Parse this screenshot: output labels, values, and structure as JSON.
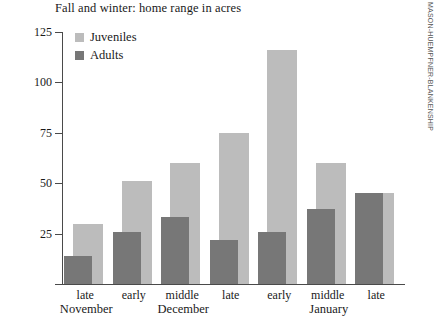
{
  "chart_data": {
    "type": "bar",
    "title": "Fall and winter: home range in acres",
    "xlabel": "",
    "ylabel": "",
    "ylim": [
      0,
      125
    ],
    "yticks": [
      25,
      50,
      75,
      100,
      125
    ],
    "grid": false,
    "legend_position": "top-left",
    "categories": [
      "late",
      "early",
      "middle",
      "late",
      "early",
      "middle",
      "late"
    ],
    "group_labels": [
      {
        "label": "November",
        "category_index": 0
      },
      {
        "label": "December",
        "category_index": 2
      },
      {
        "label": "January",
        "category_index": 5
      }
    ],
    "series": [
      {
        "name": "Juveniles",
        "color": "#bcbcbc",
        "values": [
          30,
          51,
          60,
          75,
          116,
          60,
          45
        ]
      },
      {
        "name": "Adults",
        "color": "#777777",
        "values": [
          14,
          26,
          33,
          22,
          26,
          37,
          45
        ]
      }
    ]
  },
  "credit": "MASON-HUEMPFNER-BLANKENSHIP",
  "axis": {
    "tick_labels": [
      "125",
      "100",
      "75",
      "50",
      "25"
    ]
  }
}
